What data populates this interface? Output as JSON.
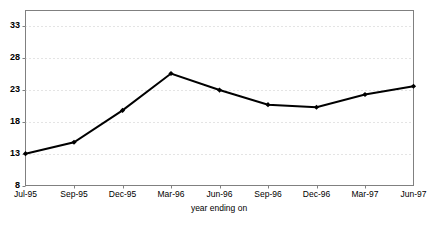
{
  "chart_data": {
    "type": "line",
    "title": "",
    "xlabel": "year ending on",
    "ylabel": "",
    "categories": [
      "Jul-95",
      "Sep-95",
      "Dec-95",
      "Mar-96",
      "Jun-96",
      "Sep-96",
      "Dec-96",
      "Mar-97",
      "Jun-97"
    ],
    "values": [
      13.0,
      14.8,
      19.8,
      25.6,
      23.0,
      20.7,
      20.3,
      22.3,
      23.6
    ],
    "ylim": [
      8,
      35.5
    ],
    "yticks": [
      8,
      13,
      18,
      23,
      28,
      33
    ],
    "ytick_labels": [
      "8",
      "13",
      "18",
      "23",
      "28",
      "33"
    ],
    "grid": true,
    "grid_style": "dotted-horizontal",
    "legend": "none",
    "series": [
      {
        "name": "series-1",
        "values": [
          13.0,
          14.8,
          19.8,
          25.6,
          23.0,
          20.7,
          20.3,
          22.3,
          23.6
        ]
      }
    ],
    "colors": {
      "line": "#000000",
      "marker": "#000000",
      "grid": "#c8c8c8",
      "axis": "#808080",
      "frame": "#808080",
      "background": "#ffffff"
    },
    "marker": "diamond",
    "line_width": 2
  }
}
